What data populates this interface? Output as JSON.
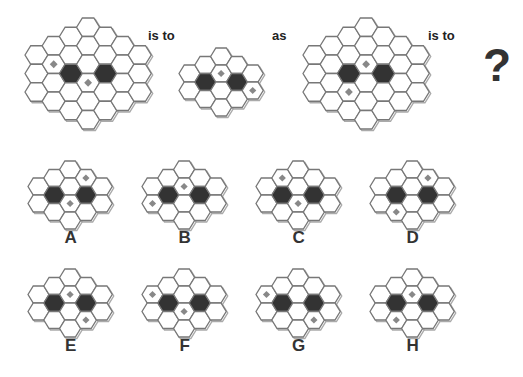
{
  "colors": {
    "stroke": "#777777",
    "shadow": "#aaaaaa",
    "fill": "#ffffff",
    "black": "#333333",
    "diamond": "#888888"
  },
  "words": {
    "is_to_1": "is to",
    "as": "as",
    "is_to_2": "is to",
    "question": "?"
  },
  "shapes": {
    "large": {
      "cols": [
        [
          3,
          3
        ],
        [
          2,
          4
        ],
        [
          1,
          5
        ],
        [
          0,
          6
        ],
        [
          1,
          5
        ],
        [
          2,
          4
        ],
        [
          3,
          3
        ]
      ],
      "hexW": 23,
      "hexH": 18.5,
      "colStep": 17.2
    },
    "small": {
      "cols": [
        [
          2,
          2
        ],
        [
          1,
          3
        ],
        [
          0,
          4
        ],
        [
          1,
          3
        ],
        [
          2,
          2
        ]
      ],
      "hexW": 21,
      "hexH": 17,
      "colStep": 15.8
    }
  },
  "question": {
    "grids": [
      {
        "id": "q1",
        "shape": "large",
        "x": 24,
        "y": 17,
        "black": [
          [
            2,
            5
          ],
          [
            4,
            5
          ]
        ],
        "diamonds": [
          [
            1,
            4
          ],
          [
            3,
            6
          ]
        ]
      },
      {
        "id": "q2",
        "shape": "small",
        "x": 178,
        "y": 47,
        "black": [
          [
            1,
            3
          ],
          [
            3,
            3
          ]
        ],
        "diamonds": [
          [
            2,
            2
          ],
          [
            4,
            4
          ]
        ]
      },
      {
        "id": "q3",
        "shape": "large",
        "x": 302,
        "y": 17,
        "black": [
          [
            2,
            5
          ],
          [
            4,
            5
          ]
        ],
        "diamonds": [
          [
            3,
            4
          ],
          [
            2,
            7
          ]
        ]
      }
    ]
  },
  "options": [
    {
      "label": "A",
      "x": 27,
      "y": 160,
      "black": [
        [
          1,
          3
        ],
        [
          3,
          3
        ]
      ],
      "diamonds": [
        [
          3,
          1
        ],
        [
          2,
          4
        ]
      ]
    },
    {
      "label": "B",
      "x": 141,
      "y": 160,
      "black": [
        [
          1,
          3
        ],
        [
          3,
          3
        ]
      ],
      "diamonds": [
        [
          2,
          2
        ],
        [
          0,
          4
        ]
      ]
    },
    {
      "label": "C",
      "x": 255,
      "y": 160,
      "black": [
        [
          1,
          3
        ],
        [
          3,
          3
        ]
      ],
      "diamonds": [
        [
          1,
          1
        ],
        [
          2,
          4
        ]
      ]
    },
    {
      "label": "D",
      "x": 369,
      "y": 160,
      "black": [
        [
          1,
          3
        ],
        [
          3,
          3
        ]
      ],
      "diamonds": [
        [
          3,
          1
        ],
        [
          1,
          5
        ]
      ]
    },
    {
      "label": "E",
      "x": 27,
      "y": 268,
      "black": [
        [
          1,
          3
        ],
        [
          3,
          3
        ]
      ],
      "diamonds": [
        [
          2,
          2
        ],
        [
          3,
          5
        ]
      ]
    },
    {
      "label": "F",
      "x": 141,
      "y": 268,
      "black": [
        [
          1,
          3
        ],
        [
          3,
          3
        ]
      ],
      "diamonds": [
        [
          0,
          2
        ],
        [
          2,
          4
        ]
      ]
    },
    {
      "label": "G",
      "x": 255,
      "y": 268,
      "black": [
        [
          1,
          3
        ],
        [
          3,
          3
        ]
      ],
      "diamonds": [
        [
          0,
          2
        ],
        [
          3,
          5
        ]
      ]
    },
    {
      "label": "H",
      "x": 369,
      "y": 268,
      "black": [
        [
          1,
          3
        ],
        [
          3,
          3
        ]
      ],
      "diamonds": [
        [
          2,
          2
        ],
        [
          1,
          5
        ]
      ]
    }
  ]
}
